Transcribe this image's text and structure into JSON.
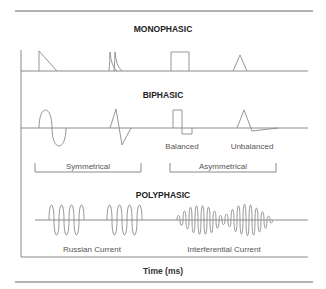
{
  "diagram": {
    "sections": [
      {
        "title": "MONOPHASIC",
        "waveforms": [
          "sawtooth-decay-pulse",
          "twin-spike-pulses",
          "rectangular-pulse",
          "triangular-pulse"
        ]
      },
      {
        "title": "BIPHASIC",
        "waveforms": [
          "sine-cycle",
          "triangular-biphasic",
          "balanced-rectangular",
          "unbalanced-triangular"
        ],
        "labels": {
          "balanced": "Balanced",
          "unbalanced": "Unbalanced",
          "symmetrical": "Symmetrical",
          "asymmetrical": "Asymmetrical"
        }
      },
      {
        "title": "POLYPHASIC",
        "waveforms": [
          "russian-current-bursts",
          "interferential-current-beats"
        ],
        "labels": {
          "russian": "Russian Current",
          "interferential": "Interferential Current"
        }
      }
    ],
    "x_axis_label": "Time (ms)",
    "colors": {
      "waveform": "#8a8a8a",
      "text": "#333333",
      "rule": "#9a9a9a"
    }
  }
}
